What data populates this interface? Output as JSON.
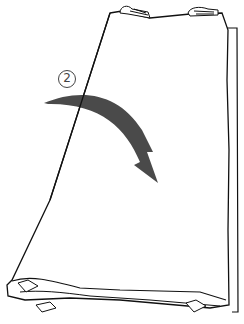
{
  "diagram": {
    "step_number": "2",
    "colors": {
      "outline": "#111111",
      "arrow": "#4a4a4a",
      "background": "#ffffff"
    },
    "icons": [
      "curved-arrow-icon",
      "fold-ties-icon"
    ]
  }
}
